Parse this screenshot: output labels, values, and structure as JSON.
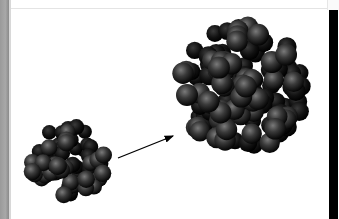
{
  "figure": {
    "colors": {
      "background": "#ffffff",
      "sphere_dark": "#0a0a0a",
      "sphere_light": "#6e6e6e",
      "left_strip": "#a0a0a0",
      "right_strip": "#000000"
    },
    "small_cluster": {
      "cx": 68,
      "cy": 162,
      "r": 44
    },
    "large_cluster": {
      "cx": 243,
      "cy": 88,
      "r": 70
    },
    "arrow": {
      "from": [
        118,
        158
      ],
      "to": [
        174,
        135
      ]
    }
  }
}
